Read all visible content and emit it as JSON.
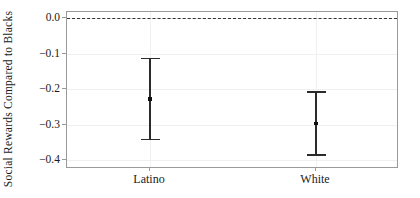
{
  "chart_data": {
    "type": "scatter",
    "title": "",
    "subtitle": "",
    "xlabel": "",
    "ylabel": "Social Rewards Compared to Blacks",
    "categories": [
      "Latino",
      "White"
    ],
    "ytick_labels": [
      "0.0",
      "−0.1",
      "−0.2",
      "−0.3",
      "−0.4"
    ],
    "ytick_values": [
      0.0,
      -0.1,
      -0.2,
      -0.3,
      -0.4
    ],
    "ylim": [
      -0.425,
      0.018
    ],
    "grid": true,
    "grid_axis": "both",
    "legend": "none",
    "series": [
      {
        "name": "Point estimate with confidence interval",
        "values": [
          -0.228,
          -0.297
        ],
        "ci_low": [
          -0.339,
          -0.384
        ],
        "ci_high": [
          -0.112,
          -0.206
        ]
      }
    ],
    "annotations": [
      {
        "type": "hline",
        "value": 0.0,
        "style": "dashed",
        "color": "#333333",
        "label": "zero reference line"
      }
    ],
    "colors": {
      "marker": "#111111",
      "errorbar": "#2b2b2b",
      "axis": "#9a9a9a",
      "grid": "#f0f0f0",
      "background": "#ffffff"
    }
  }
}
